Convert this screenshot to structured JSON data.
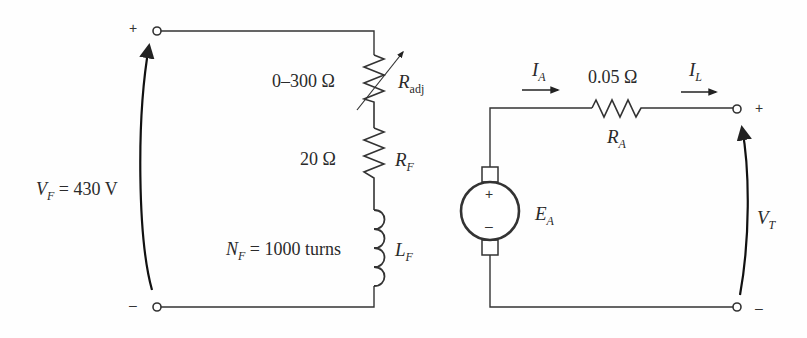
{
  "diagram": {
    "field_circuit": {
      "plus_sign": "+",
      "minus_sign": "–",
      "voltage_label": {
        "symbol": "V",
        "subscript": "F",
        "value": "= 430 V"
      },
      "rheostat": {
        "range": "0–300 Ω",
        "symbol": "R",
        "subscript": "adj"
      },
      "field_resistor": {
        "value": "20 Ω",
        "symbol": "R",
        "subscript": "F"
      },
      "field_inductor": {
        "turns_symbol": "N",
        "turns_subscript": "F",
        "turns_value": "= 1000 turns",
        "symbol": "L",
        "subscript": "F"
      }
    },
    "armature_circuit": {
      "armature_current": {
        "symbol": "I",
        "subscript": "A"
      },
      "load_current": {
        "symbol": "I",
        "subscript": "L"
      },
      "armature_resistor": {
        "value": "0.05 Ω",
        "symbol": "R",
        "subscript": "A"
      },
      "internal_voltage": {
        "symbol": "E",
        "subscript": "A",
        "plus": "+",
        "minus": "–"
      },
      "terminal_voltage": {
        "symbol": "V",
        "subscript": "T"
      },
      "plus_sign": "+",
      "minus_sign": "–"
    },
    "colors": {
      "wire": "#333333",
      "background": "#fefefe",
      "text": "#2a2a2a"
    }
  }
}
